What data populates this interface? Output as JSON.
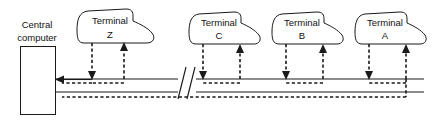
{
  "diagram": {
    "type": "network-topology-multidrop-bus",
    "title": "",
    "width": 436,
    "height": 130,
    "colors": {
      "line": "#1a1a1a",
      "background": "#ffffff",
      "text": "#111111"
    },
    "host": {
      "name": "central-computer",
      "label_line1": "Central",
      "label_line2": "computer",
      "box": {
        "x": 20,
        "y": 46,
        "width": 35,
        "height": 69
      }
    },
    "bus": {
      "outbound_line_y": 79,
      "return_line_y": 92,
      "left_x": 55,
      "right_x": 424,
      "break_x": 186,
      "outbound_arrow_label": "to-central-computer",
      "return_arrow_label": "downstream-return"
    },
    "terminals": [
      {
        "id": "terminal-z",
        "label_line1": "Terminal",
        "label_line2": "Z",
        "shape_x": 78,
        "shape_y": 8,
        "shape_width": 76,
        "shape_height": 36,
        "down_drop_x": 92,
        "up_drop_x": 124
      },
      {
        "id": "terminal-c",
        "label_line1": "Terminal",
        "label_line2": "C",
        "shape_x": 190,
        "shape_y": 11,
        "shape_width": 74,
        "shape_height": 34,
        "down_drop_x": 203,
        "up_drop_x": 240
      },
      {
        "id": "terminal-b",
        "label_line1": "Terminal",
        "label_line2": "B",
        "shape_x": 273,
        "shape_y": 11,
        "shape_width": 74,
        "shape_height": 34,
        "down_drop_x": 286,
        "up_drop_x": 323
      },
      {
        "id": "terminal-a",
        "label_line1": "Terminal",
        "label_line2": "A",
        "shape_x": 356,
        "shape_y": 11,
        "shape_width": 74,
        "shape_height": 34,
        "down_drop_x": 369,
        "up_drop_x": 406
      }
    ]
  }
}
